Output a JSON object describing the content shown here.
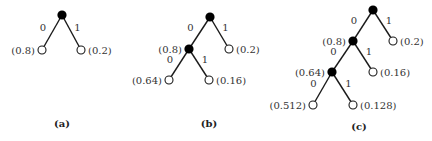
{
  "figure": {
    "panels": [
      {
        "caption": "(a)",
        "edges": [
          {
            "from": [
              62,
              15
            ],
            "to": [
              42,
              50
            ],
            "label": "0"
          },
          {
            "from": [
              62,
              15
            ],
            "to": [
              81,
              50
            ],
            "label": "1"
          }
        ],
        "nodes": [
          {
            "x": 62,
            "y": 15,
            "type": "internal",
            "prob": ""
          },
          {
            "x": 42,
            "y": 50,
            "type": "leaf",
            "prob": "(0.8)",
            "side": "left"
          },
          {
            "x": 81,
            "y": 50,
            "type": "leaf",
            "prob": "(0.2)",
            "side": "right"
          }
        ]
      },
      {
        "caption": "(b)",
        "edges": [
          {
            "from": [
              210,
              17
            ],
            "to": [
              189,
              49
            ],
            "label": "0"
          },
          {
            "from": [
              210,
              17
            ],
            "to": [
              229,
              49
            ],
            "label": "1"
          },
          {
            "from": [
              189,
              49
            ],
            "to": [
              169,
              80
            ],
            "label": "0"
          },
          {
            "from": [
              189,
              49
            ],
            "to": [
              209,
              80
            ],
            "label": "1"
          }
        ],
        "nodes": [
          {
            "x": 210,
            "y": 17,
            "type": "internal",
            "prob": ""
          },
          {
            "x": 189,
            "y": 49,
            "type": "internal",
            "prob": "(0.8)",
            "side": "left"
          },
          {
            "x": 229,
            "y": 49,
            "type": "leaf",
            "prob": "(0.2)",
            "side": "right"
          },
          {
            "x": 169,
            "y": 80,
            "type": "leaf",
            "prob": "(0.64)",
            "side": "left"
          },
          {
            "x": 209,
            "y": 80,
            "type": "leaf",
            "prob": "(0.16)",
            "side": "right"
          }
        ]
      },
      {
        "caption": "(c)",
        "edges": [
          {
            "from": [
              373,
              10
            ],
            "to": [
              353,
              41
            ],
            "label": "0"
          },
          {
            "from": [
              373,
              10
            ],
            "to": [
              393,
              41
            ],
            "label": "1"
          },
          {
            "from": [
              353,
              41
            ],
            "to": [
              332,
              72
            ],
            "label": "0"
          },
          {
            "from": [
              353,
              41
            ],
            "to": [
              373,
              72
            ],
            "label": "1"
          },
          {
            "from": [
              332,
              72
            ],
            "to": [
              313,
              105
            ],
            "label": "0"
          },
          {
            "from": [
              332,
              72
            ],
            "to": [
              353,
              105
            ],
            "label": "1"
          }
        ],
        "nodes": [
          {
            "x": 373,
            "y": 10,
            "type": "internal",
            "prob": ""
          },
          {
            "x": 353,
            "y": 41,
            "type": "internal",
            "prob": "(0.8)",
            "side": "left"
          },
          {
            "x": 393,
            "y": 41,
            "type": "leaf",
            "prob": "(0.2)",
            "side": "right"
          },
          {
            "x": 332,
            "y": 72,
            "type": "internal",
            "prob": "(0.64)",
            "side": "left"
          },
          {
            "x": 373,
            "y": 72,
            "type": "leaf",
            "prob": "(0.16)",
            "side": "right"
          },
          {
            "x": 313,
            "y": 105,
            "type": "leaf",
            "prob": "(0.512)",
            "side": "left"
          },
          {
            "x": 353,
            "y": 105,
            "type": "leaf",
            "prob": "(0.128)",
            "side": "right"
          }
        ]
      }
    ],
    "caption_positions": [
      [
        62,
        127
      ],
      [
        209,
        127
      ],
      [
        359,
        130
      ]
    ]
  }
}
